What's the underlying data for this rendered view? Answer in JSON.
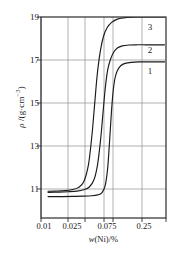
{
  "chart_data": {
    "type": "line",
    "title": "",
    "subtitle": "",
    "xlabel": "w(Ni)/%",
    "xlabel_parts": {
      "italic": "w",
      "rest": "(Ni)/%"
    },
    "ylabel": "ρ /(g·cm⁻³)",
    "ylabel_parts": {
      "symbol": "ρ",
      "sep": " /(g·cm",
      "exp": "−3",
      "close": ")"
    },
    "xscale": "log",
    "xlim": [
      0.008,
      0.42
    ],
    "ylim": [
      9.6,
      19.0
    ],
    "grid": true,
    "grid_color": "#8f8f8f",
    "axis_color": "#2b2b2b",
    "curve_color": "#1a1a1a",
    "legend": "inline-curve-numbers",
    "xticks": [
      {
        "value": 0.01,
        "label": "0.01"
      },
      {
        "value": 0.025,
        "label": "0.025"
      },
      {
        "value": 0.075,
        "label": "0.075"
      },
      {
        "value": 0.25,
        "label": "0.25"
      }
    ],
    "x_gridlines": [
      0.01,
      0.025,
      0.05,
      0.075,
      0.1,
      0.25
    ],
    "yticks": [
      {
        "value": 19,
        "label": "19"
      },
      {
        "value": 17,
        "label": "17"
      },
      {
        "value": 15,
        "label": "15"
      },
      {
        "value": 13,
        "label": "13"
      },
      {
        "value": 11,
        "label": "11"
      }
    ],
    "series": [
      {
        "name": "3",
        "label": "3",
        "baseline": 10.85,
        "plateau": 19.0,
        "midpoint_x": 0.047,
        "points_x": [
          0.01,
          0.013,
          0.017,
          0.021,
          0.026,
          0.031,
          0.036,
          0.04,
          0.043,
          0.046,
          0.049,
          0.053,
          0.058,
          0.065,
          0.075,
          0.09,
          0.11,
          0.14,
          0.18,
          0.25,
          0.33,
          0.4
        ],
        "points_y": [
          10.85,
          10.86,
          10.88,
          10.92,
          11.02,
          11.3,
          12.1,
          13.4,
          14.6,
          15.8,
          16.7,
          17.5,
          18.1,
          18.5,
          18.75,
          18.9,
          18.96,
          18.99,
          19.0,
          19.0,
          19.0,
          19.0
        ]
      },
      {
        "name": "2",
        "label": "2",
        "baseline": 10.8,
        "plateau": 17.7,
        "midpoint_x": 0.058,
        "points_x": [
          0.01,
          0.014,
          0.019,
          0.025,
          0.031,
          0.037,
          0.043,
          0.048,
          0.053,
          0.057,
          0.061,
          0.066,
          0.072,
          0.08,
          0.09,
          0.105,
          0.13,
          0.17,
          0.22,
          0.28,
          0.35,
          0.4
        ],
        "points_y": [
          10.8,
          10.81,
          10.83,
          10.86,
          10.92,
          11.05,
          11.4,
          12.1,
          13.3,
          14.5,
          15.6,
          16.5,
          17.0,
          17.35,
          17.55,
          17.65,
          17.69,
          17.7,
          17.7,
          17.7,
          17.7,
          17.7
        ]
      },
      {
        "name": "1",
        "label": "1",
        "baseline": 10.6,
        "plateau": 16.9,
        "midpoint_x": 0.072,
        "points_x": [
          0.01,
          0.015,
          0.022,
          0.03,
          0.04,
          0.048,
          0.055,
          0.061,
          0.066,
          0.07,
          0.074,
          0.078,
          0.083,
          0.09,
          0.1,
          0.115,
          0.14,
          0.18,
          0.23,
          0.29,
          0.35,
          0.4
        ],
        "points_y": [
          10.6,
          10.6,
          10.61,
          10.62,
          10.64,
          10.68,
          10.78,
          11.1,
          11.9,
          13.1,
          14.4,
          15.4,
          16.1,
          16.5,
          16.72,
          16.83,
          16.88,
          16.9,
          16.9,
          16.9,
          16.9,
          16.9
        ]
      }
    ],
    "curve_labels": [
      {
        "text": "3",
        "x_px": 150,
        "y_px": 27
      },
      {
        "text": "2",
        "x_px": 150,
        "y_px": 50
      },
      {
        "text": "1",
        "x_px": 150,
        "y_px": 71
      }
    ]
  }
}
